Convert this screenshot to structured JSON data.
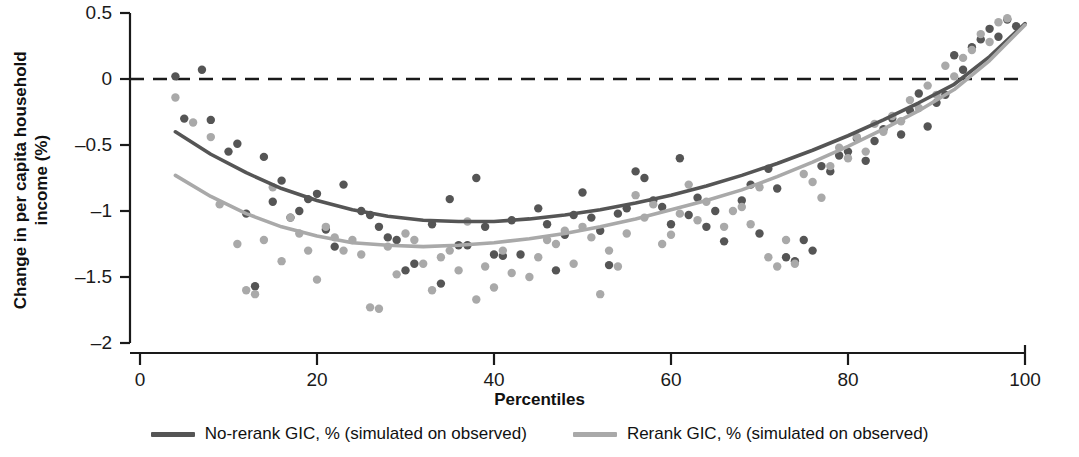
{
  "chart_data": {
    "type": "scatter",
    "title": "",
    "xlabel": "Percentiles",
    "ylabel_line1": "Change in per capita household",
    "ylabel_line2": "income (%)",
    "xlim": [
      0,
      100
    ],
    "ylim": [
      -2,
      0.5
    ],
    "xticks": [
      "0",
      "20",
      "40",
      "60",
      "80",
      "100"
    ],
    "xtick_values": [
      0,
      20,
      40,
      60,
      80,
      100
    ],
    "yticks": [
      "0.5",
      "0",
      "–0.5",
      "–1",
      "–1.5",
      "–2"
    ],
    "ytick_values": [
      0.5,
      0,
      -0.5,
      -1,
      -1.5,
      -2
    ],
    "grid": false,
    "legend_position": "below",
    "reference_line": {
      "y": 0,
      "style": "dashed",
      "color": "#1a1a1a"
    },
    "colors": {
      "dark": "#555555",
      "light": "#a9a9a9",
      "axis": "#1a1a1a",
      "text": "#111111"
    },
    "series": [
      {
        "name": "No-rerank GIC, % (simulated on observed)",
        "color": "#555555",
        "fit_label": "quadratic fit",
        "fit_x": [
          4,
          8,
          12,
          16,
          20,
          24,
          28,
          32,
          36,
          40,
          44,
          48,
          52,
          56,
          60,
          64,
          68,
          72,
          76,
          80,
          84,
          88,
          92,
          96,
          100
        ],
        "fit_y": [
          -0.4,
          -0.57,
          -0.71,
          -0.83,
          -0.92,
          -0.99,
          -1.04,
          -1.07,
          -1.08,
          -1.08,
          -1.06,
          -1.03,
          -0.99,
          -0.94,
          -0.88,
          -0.81,
          -0.73,
          -0.64,
          -0.54,
          -0.43,
          -0.31,
          -0.18,
          -0.04,
          0.17,
          0.42
        ],
        "scatter_x": [
          4,
          5,
          7,
          8,
          10,
          11,
          12,
          13,
          14,
          15,
          16,
          17,
          18,
          19,
          20,
          21,
          22,
          23,
          25,
          26,
          27,
          28,
          29,
          30,
          31,
          33,
          34,
          35,
          36,
          37,
          38,
          39,
          40,
          41,
          42,
          43,
          45,
          46,
          47,
          48,
          49,
          50,
          51,
          52,
          53,
          54,
          55,
          56,
          57,
          58,
          59,
          60,
          61,
          62,
          63,
          64,
          65,
          66,
          68,
          69,
          70,
          71,
          72,
          73,
          74,
          75,
          76,
          77,
          78,
          79,
          80,
          81,
          82,
          83,
          84,
          85,
          86,
          87,
          88,
          89,
          90,
          91,
          92,
          93,
          94,
          95,
          96,
          97,
          98,
          99
        ],
        "scatter_y": [
          0.02,
          -0.3,
          0.07,
          -0.31,
          -0.55,
          -0.49,
          -1.02,
          -1.57,
          -0.59,
          -0.93,
          -0.77,
          -1.05,
          -1.0,
          -0.91,
          -0.87,
          -1.14,
          -1.27,
          -0.8,
          -1.0,
          -1.03,
          -1.12,
          -1.2,
          -1.22,
          -1.45,
          -1.4,
          -1.1,
          -1.55,
          -0.91,
          -1.26,
          -1.26,
          -0.75,
          -1.12,
          -1.33,
          -1.34,
          -1.07,
          -1.33,
          -0.98,
          -1.1,
          -1.45,
          -1.18,
          -1.03,
          -0.86,
          -1.05,
          -1.15,
          -1.41,
          -1.02,
          -0.98,
          -0.7,
          -0.75,
          -0.92,
          -0.97,
          -1.1,
          -0.6,
          -1.03,
          -0.9,
          -1.12,
          -1.0,
          -1.23,
          -0.92,
          -0.8,
          -1.17,
          -0.68,
          -0.83,
          -1.35,
          -1.38,
          -1.22,
          -1.3,
          -0.66,
          -0.7,
          -0.58,
          -0.55,
          -0.45,
          -0.62,
          -0.47,
          -0.38,
          -0.3,
          -0.42,
          -0.24,
          -0.11,
          -0.36,
          -0.18,
          -0.12,
          0.18,
          0.07,
          0.24,
          0.3,
          0.38,
          0.32,
          0.45,
          0.4
        ]
      },
      {
        "name": "Rerank GIC, % (simulated on observed)",
        "color": "#a9a9a9",
        "fit_label": "quadratic fit",
        "fit_x": [
          4,
          8,
          12,
          16,
          20,
          24,
          28,
          32,
          36,
          40,
          44,
          48,
          52,
          56,
          60,
          64,
          68,
          72,
          76,
          80,
          84,
          88,
          92,
          96,
          100
        ],
        "fit_y": [
          -0.73,
          -0.89,
          -1.02,
          -1.12,
          -1.19,
          -1.24,
          -1.26,
          -1.27,
          -1.26,
          -1.24,
          -1.21,
          -1.17,
          -1.12,
          -1.06,
          -0.99,
          -0.92,
          -0.84,
          -0.74,
          -0.63,
          -0.51,
          -0.38,
          -0.24,
          -0.08,
          0.14,
          0.41
        ],
        "scatter_x": [
          4,
          6,
          8,
          9,
          11,
          12,
          13,
          14,
          15,
          16,
          17,
          18,
          19,
          20,
          21,
          22,
          23,
          24,
          25,
          26,
          27,
          28,
          29,
          30,
          31,
          32,
          33,
          34,
          35,
          36,
          37,
          38,
          39,
          40,
          41,
          42,
          44,
          45,
          46,
          47,
          48,
          49,
          50,
          51,
          52,
          53,
          54,
          55,
          56,
          57,
          58,
          59,
          60,
          61,
          62,
          63,
          64,
          66,
          67,
          68,
          69,
          70,
          71,
          72,
          73,
          74,
          75,
          76,
          77,
          78,
          79,
          80,
          81,
          82,
          83,
          84,
          85,
          86,
          87,
          88,
          89,
          90,
          91,
          92,
          93,
          94,
          95,
          96,
          97,
          98
        ],
        "scatter_y": [
          -0.14,
          -0.33,
          -0.44,
          -0.95,
          -1.25,
          -1.6,
          -1.63,
          -1.22,
          -0.82,
          -1.38,
          -1.05,
          -1.17,
          -1.3,
          -1.52,
          -1.12,
          -1.2,
          -1.3,
          -1.22,
          -1.33,
          -1.73,
          -1.74,
          -1.27,
          -1.48,
          -1.17,
          -1.22,
          -1.4,
          -1.6,
          -1.35,
          -1.3,
          -1.45,
          -1.08,
          -1.67,
          -1.42,
          -1.58,
          -1.3,
          -1.47,
          -1.5,
          -1.35,
          -1.22,
          -1.25,
          -1.15,
          -1.4,
          -1.12,
          -1.2,
          -1.63,
          -1.3,
          -1.42,
          -1.17,
          -0.88,
          -1.05,
          -0.95,
          -1.25,
          -1.18,
          -1.02,
          -0.8,
          -1.07,
          -0.93,
          -1.12,
          -1.0,
          -0.97,
          -1.1,
          -0.82,
          -1.35,
          -1.42,
          -1.22,
          -1.4,
          -0.72,
          -0.78,
          -0.9,
          -0.66,
          -0.52,
          -0.6,
          -0.44,
          -0.55,
          -0.34,
          -0.4,
          -0.28,
          -0.32,
          -0.16,
          -0.22,
          -0.05,
          -0.12,
          0.1,
          0.02,
          0.16,
          0.22,
          0.34,
          0.28,
          0.43,
          0.46
        ]
      }
    ]
  },
  "legend": [
    {
      "label": "No-rerank GIC, % (simulated on observed)",
      "color": "#555555"
    },
    {
      "label": "Rerank GIC, % (simulated on observed)",
      "color": "#a9a9a9"
    }
  ]
}
